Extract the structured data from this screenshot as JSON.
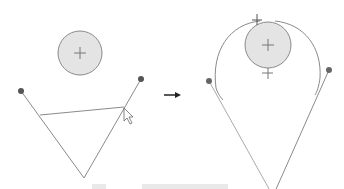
{
  "diagram": {
    "colors": {
      "line": "#8a8a8a",
      "circle_fill": "#e4e4e4",
      "circle_stroke": "#8a8a8a",
      "endpoint": "#555555",
      "arrow": "#222222"
    },
    "left_panel": {
      "circle": {
        "cx": 80,
        "cy": 53,
        "r": 22
      },
      "endpoints": [
        [
          21,
          91
        ],
        [
          141,
          79
        ]
      ],
      "vertex": [
        84,
        178
      ],
      "cross_line": [
        [
          40,
          115
        ],
        [
          124,
          107
        ]
      ],
      "cursor": [
        124,
        108
      ]
    },
    "arrow": {
      "from": [
        164,
        95
      ],
      "to": [
        180,
        95
      ]
    },
    "right_panel": {
      "circle": {
        "cx": 268,
        "cy": 45,
        "r": 23
      },
      "endpoints": [
        [
          209,
          81
        ],
        [
          329,
          70
        ]
      ],
      "vertex": [
        273,
        196
      ]
    }
  }
}
